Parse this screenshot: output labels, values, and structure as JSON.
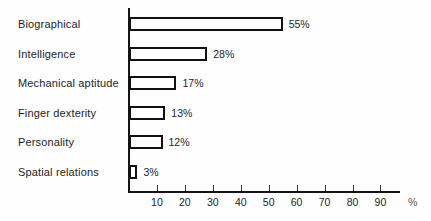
{
  "chart_data": {
    "type": "bar",
    "orientation": "horizontal",
    "title": "",
    "subtitle": "",
    "xlabel": "%",
    "ylabel": "",
    "categories": [
      "Biographical",
      "Intelligence",
      "Mechanical aptitude",
      "Finger dexterity",
      "Personality",
      "Spatial relations"
    ],
    "values": [
      55,
      28,
      17,
      13,
      12,
      3
    ],
    "value_labels": [
      "55%",
      "28%",
      "17%",
      "13%",
      "12%",
      "3%"
    ],
    "xlim": [
      0,
      97
    ],
    "xticks": [
      10,
      20,
      30,
      40,
      50,
      60,
      70,
      80,
      90
    ],
    "xtick_labels": [
      "10",
      "20",
      "30",
      "40",
      "50",
      "60",
      "70",
      "80",
      "90"
    ],
    "unit_label": "%",
    "grid": false,
    "legend": null,
    "bar_fill_color": "#ffffff",
    "bar_edge_color": "#111111",
    "axis_color": "#141414",
    "text_color": "#1d1d1d",
    "background_color": "#fefefe"
  }
}
